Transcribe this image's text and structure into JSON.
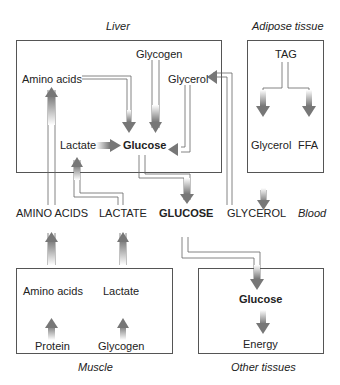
{
  "regions": {
    "liver": "Liver",
    "adipose": "Adipose tissue",
    "muscle": "Muscle",
    "other": "Other tissues",
    "blood": "Blood"
  },
  "liver": {
    "glycogen": "Glycogen",
    "amino_acids": "Amino acids",
    "glycerol": "Glycerol",
    "lactate": "Lactate",
    "glucose": "Glucose"
  },
  "adipose": {
    "tag": "TAG",
    "glycerol": "Glycerol",
    "ffa": "FFA"
  },
  "blood": {
    "amino_acids": "AMINO ACIDS",
    "lactate": "LACTATE",
    "glucose": "GLUCOSE",
    "glycerol": "GLYCEROL"
  },
  "muscle": {
    "amino_acids": "Amino acids",
    "lactate": "Lactate",
    "protein": "Protein",
    "glycogen": "Glycogen"
  },
  "other": {
    "glucose": "Glucose",
    "energy": "Energy"
  },
  "colors": {
    "arrow": "#7a7a7a",
    "box_border": "#555555",
    "text": "#222222"
  }
}
